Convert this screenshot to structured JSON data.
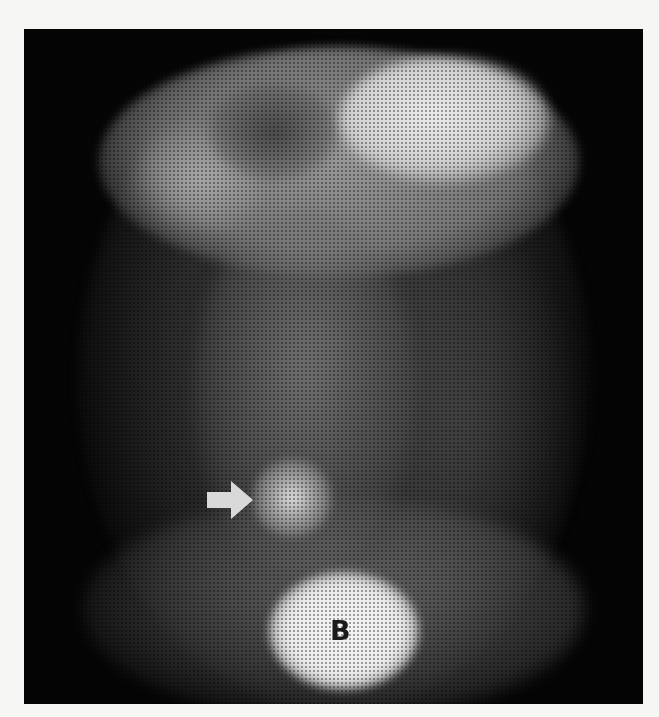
{
  "image": {
    "description": "Grayscale planar nuclear medicine abdominal scan with bright focal uptake in the right lower abdomen indicated by an arrow, bright gastric uptake at the upper right, and bladder activity at the bottom",
    "background_color": "#f6f6f4",
    "scan_background_color": "#050505"
  },
  "annotations": {
    "arrow": {
      "icon": "arrow-right-icon",
      "color": "#d9d9d9",
      "points_to": "focal-uptake"
    },
    "bladder_label": "B"
  },
  "regions": [
    {
      "name": "stomach",
      "intensity": "high"
    },
    {
      "name": "focal-uptake",
      "intensity": "high"
    },
    {
      "name": "bladder",
      "intensity": "very-high"
    }
  ]
}
